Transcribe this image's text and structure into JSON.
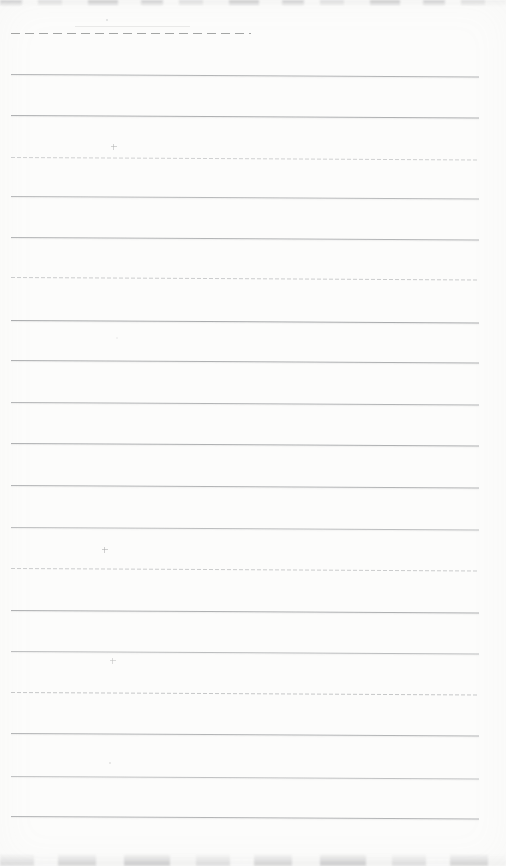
{
  "page": {
    "kind": "scanned blank lined notebook page",
    "width": 506,
    "height": 866,
    "background_color": "#fcfcfb",
    "visible_text": ""
  },
  "header_rules": [
    {
      "y": 26,
      "x": 75,
      "width": 115,
      "style": "streak",
      "color": "#9a9c9b",
      "opacity": 0.18
    },
    {
      "y": 33,
      "x": 11,
      "width": 240,
      "style": "dashed",
      "color": "#828483",
      "opacity": 0.72
    }
  ],
  "ruling": {
    "line_color": "#a2a4a6",
    "x_start": 11,
    "x_end": 479,
    "skew_deg": 0.3,
    "line_count": 19,
    "lines": [
      {
        "y": 74,
        "opacity": 0.8,
        "style": "solid"
      },
      {
        "y": 115,
        "opacity": 0.85,
        "style": "solid"
      },
      {
        "y": 157,
        "opacity": 0.5,
        "style": "dotted"
      },
      {
        "y": 196,
        "opacity": 0.75,
        "style": "solid"
      },
      {
        "y": 237,
        "opacity": 0.8,
        "style": "solid"
      },
      {
        "y": 277,
        "opacity": 0.55,
        "style": "dotted"
      },
      {
        "y": 320,
        "opacity": 0.9,
        "style": "solid"
      },
      {
        "y": 360,
        "opacity": 0.85,
        "style": "solid"
      },
      {
        "y": 402,
        "opacity": 0.8,
        "style": "solid"
      },
      {
        "y": 443,
        "opacity": 0.85,
        "style": "solid"
      },
      {
        "y": 485,
        "opacity": 0.8,
        "style": "solid"
      },
      {
        "y": 527,
        "opacity": 0.7,
        "style": "solid"
      },
      {
        "y": 568,
        "opacity": 0.55,
        "style": "dotted"
      },
      {
        "y": 610,
        "opacity": 0.85,
        "style": "solid"
      },
      {
        "y": 651,
        "opacity": 0.7,
        "style": "solid"
      },
      {
        "y": 692,
        "opacity": 0.6,
        "style": "dotted"
      },
      {
        "y": 733,
        "opacity": 0.8,
        "style": "solid"
      },
      {
        "y": 776,
        "opacity": 0.65,
        "style": "solid"
      },
      {
        "y": 816,
        "opacity": 0.8,
        "style": "solid"
      }
    ]
  },
  "specks": [
    {
      "x": 106,
      "y": 19,
      "shape": "dot",
      "opacity": 0.45
    },
    {
      "x": 111,
      "y": 144,
      "shape": "cross",
      "opacity": 0.55
    },
    {
      "x": 116,
      "y": 337,
      "shape": "dot",
      "opacity": 0.2
    },
    {
      "x": 102,
      "y": 547,
      "shape": "cross",
      "opacity": 0.6
    },
    {
      "x": 110,
      "y": 658,
      "shape": "cross",
      "opacity": 0.45
    },
    {
      "x": 109,
      "y": 762,
      "shape": "dot",
      "opacity": 0.4
    }
  ],
  "edges": {
    "top_texture": "faint mottled gray scan edge",
    "bottom_texture": "faint mottled gray scan edge"
  }
}
